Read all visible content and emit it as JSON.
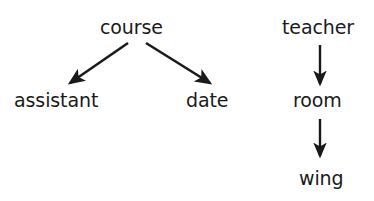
{
  "diagram": {
    "background_color": "#ffffff",
    "ink_color": "#1a1a1a",
    "nodes": [
      {
        "id": "course",
        "label": "course",
        "x": 137,
        "y": 28
      },
      {
        "id": "assistant",
        "label": "assistant",
        "x": 64,
        "y": 101
      },
      {
        "id": "date",
        "label": "date",
        "x": 214,
        "y": 101
      },
      {
        "id": "teacher",
        "label": "teacher",
        "x": 321,
        "y": 28
      },
      {
        "id": "room",
        "label": "room",
        "x": 320,
        "y": 101
      },
      {
        "id": "wing",
        "label": "wing",
        "x": 321,
        "y": 179
      }
    ],
    "edges": [
      {
        "from": "course",
        "to": "assistant",
        "x1": 128,
        "y1": 43,
        "x2": 70,
        "y2": 83,
        "arrow": "end"
      },
      {
        "from": "course",
        "to": "date",
        "x1": 146,
        "y1": 43,
        "x2": 210,
        "y2": 83,
        "arrow": "end"
      },
      {
        "from": "teacher",
        "to": "room",
        "x1": 320,
        "y1": 45,
        "x2": 320,
        "y2": 84,
        "arrow": "end"
      },
      {
        "from": "room",
        "to": "wing",
        "x1": 320,
        "y1": 119,
        "x2": 320,
        "y2": 156,
        "arrow": "end"
      }
    ]
  }
}
